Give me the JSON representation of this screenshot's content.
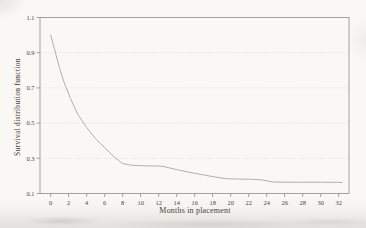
{
  "figure": {
    "background": "#f9f8f5",
    "frame_color": "#8e8c84",
    "grid_color": "#d9d8d1",
    "curve_color": "#a9a7a0",
    "text_color": "#45423b"
  },
  "chart_data": {
    "type": "line",
    "title": "",
    "xlabel": "Months in placement",
    "ylabel": "Survival distribution function",
    "xlim": [
      0,
      32
    ],
    "ylim": [
      0.1,
      1.1
    ],
    "xticks": [
      0,
      2,
      4,
      6,
      8,
      10,
      12,
      14,
      16,
      18,
      20,
      22,
      24,
      26,
      28,
      30,
      32
    ],
    "yticks": [
      0.1,
      0.3,
      0.5,
      0.7,
      0.9,
      1.1
    ],
    "grid": "faint dotted horizontal gridlines at 0.3, 0.5, 0.7, 0.9; solid plot frame",
    "legend": "none",
    "series": [
      {
        "name": "Survival distribution function",
        "x": [
          0,
          1,
          1.5,
          2.2,
          3,
          4,
          5,
          6,
          7,
          7.5,
          8,
          9,
          10,
          11,
          12,
          12.6,
          14,
          16,
          18,
          19.5,
          21,
          22,
          23.4,
          24.8,
          26,
          28,
          30,
          32.4
        ],
        "y": [
          1.0,
          0.81,
          0.73,
          0.64,
          0.55,
          0.475,
          0.41,
          0.36,
          0.31,
          0.29,
          0.27,
          0.26,
          0.258,
          0.257,
          0.256,
          0.253,
          0.235,
          0.215,
          0.196,
          0.184,
          0.182,
          0.181,
          0.178,
          0.165,
          0.164,
          0.164,
          0.164,
          0.163
        ]
      }
    ]
  }
}
